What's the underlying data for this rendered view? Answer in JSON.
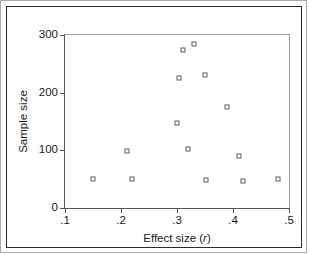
{
  "chart_data": {
    "type": "scatter",
    "title": "",
    "xlabel": "Effect size (r)",
    "xlabel_plain": "Effect size",
    "xlabel_italic_part": "r",
    "ylabel": "Sample size",
    "xlim": [
      0.1,
      0.5
    ],
    "ylim": [
      0,
      300
    ],
    "xticks": [
      0.1,
      0.2,
      0.3,
      0.4,
      0.5
    ],
    "xticklabels": [
      ".1",
      ".2",
      ".3",
      ".4",
      ".5"
    ],
    "yticks": [
      0,
      100,
      200,
      300
    ],
    "yticklabels": [
      "0",
      "100",
      "200",
      "300"
    ],
    "grid": false,
    "legend": false,
    "marker": "open-square",
    "marker_color": "#5d5d5d",
    "points": [
      {
        "x": 0.15,
        "y": 50
      },
      {
        "x": 0.21,
        "y": 98
      },
      {
        "x": 0.22,
        "y": 51
      },
      {
        "x": 0.3,
        "y": 147
      },
      {
        "x": 0.303,
        "y": 225
      },
      {
        "x": 0.311,
        "y": 274
      },
      {
        "x": 0.32,
        "y": 103
      },
      {
        "x": 0.33,
        "y": 285
      },
      {
        "x": 0.35,
        "y": 230
      },
      {
        "x": 0.351,
        "y": 49
      },
      {
        "x": 0.39,
        "y": 175
      },
      {
        "x": 0.41,
        "y": 90
      },
      {
        "x": 0.418,
        "y": 47
      },
      {
        "x": 0.48,
        "y": 51
      }
    ],
    "n_points": 14
  },
  "figure": {
    "frame": "double-border",
    "background": "#ffffff",
    "axis_color": "#555555"
  }
}
